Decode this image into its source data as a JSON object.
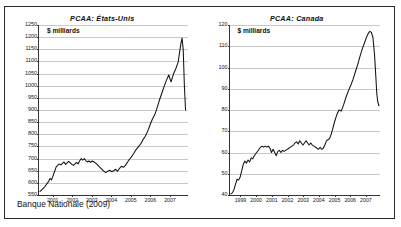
{
  "figure": {
    "source_note": "Banque Nationale (2009)",
    "border_color": "#2a2a2a",
    "line_color": "#111111",
    "grid_color": "#c9c9c9"
  },
  "chart_data": [
    {
      "type": "line",
      "title": "PCAA: États-Unis",
      "ylabel": "$ milliards",
      "xlabel": "",
      "ylim": [
        550,
        1250
      ],
      "yticks": [
        550,
        600,
        650,
        700,
        750,
        800,
        850,
        900,
        950,
        1000,
        1050,
        1100,
        1150,
        1200,
        1250
      ],
      "ytick_labels": [
        "550",
        "600",
        "650",
        "700",
        "750",
        "800",
        "850",
        "900",
        "950",
        "1000",
        "1050",
        "1100",
        "1150",
        "1200",
        "1250"
      ],
      "xlim": [
        2000.3,
        2007.9
      ],
      "xticks": [
        2001,
        2002,
        2003,
        2004,
        2005,
        2006,
        2007
      ],
      "xtick_labels": [
        "2001",
        "2002",
        "2003",
        "2004",
        "2005",
        "2006",
        "2007"
      ],
      "grid": true,
      "legend": "none",
      "x": [
        2000.35,
        2000.45,
        2000.55,
        2000.62,
        2000.7,
        2000.78,
        2000.86,
        2000.94,
        2001.02,
        2001.1,
        2001.18,
        2001.26,
        2001.34,
        2001.42,
        2001.5,
        2001.58,
        2001.66,
        2001.74,
        2001.82,
        2001.9,
        2001.98,
        2002.06,
        2002.14,
        2002.22,
        2002.3,
        2002.38,
        2002.46,
        2002.54,
        2002.62,
        2002.7,
        2002.78,
        2002.86,
        2002.94,
        2003.02,
        2003.12,
        2003.22,
        2003.32,
        2003.42,
        2003.52,
        2003.62,
        2003.72,
        2003.82,
        2003.92,
        2004.02,
        2004.12,
        2004.22,
        2004.32,
        2004.42,
        2004.52,
        2004.62,
        2004.72,
        2004.82,
        2004.92,
        2005.02,
        2005.14,
        2005.26,
        2005.38,
        2005.5,
        2005.62,
        2005.74,
        2005.86,
        2005.98,
        2006.1,
        2006.22,
        2006.34,
        2006.46,
        2006.58,
        2006.7,
        2006.82,
        2006.94,
        2007.06,
        2007.18,
        2007.3,
        2007.42,
        2007.5,
        2007.56,
        2007.62,
        2007.68,
        2007.74,
        2007.8
      ],
      "values": [
        565,
        572,
        580,
        586,
        596,
        604,
        618,
        612,
        630,
        648,
        666,
        672,
        678,
        674,
        680,
        686,
        676,
        682,
        688,
        682,
        676,
        672,
        678,
        684,
        678,
        690,
        700,
        694,
        700,
        692,
        686,
        690,
        684,
        690,
        686,
        680,
        672,
        664,
        656,
        648,
        642,
        648,
        652,
        646,
        650,
        656,
        648,
        660,
        668,
        664,
        672,
        684,
        696,
        706,
        720,
        736,
        748,
        760,
        778,
        792,
        812,
        838,
        862,
        880,
        908,
        940,
        968,
        996,
        1022,
        1044,
        1016,
        1048,
        1070,
        1096,
        1140,
        1172,
        1196,
        1150,
        1000,
        900
      ]
    },
    {
      "type": "line",
      "title": "PCAA: Canada",
      "ylabel": "$ milliards",
      "xlabel": "",
      "ylim": [
        40,
        120
      ],
      "yticks": [
        40,
        50,
        60,
        70,
        80,
        90,
        100,
        110,
        120
      ],
      "ytick_labels": [
        "40",
        "50",
        "60",
        "70",
        "80",
        "90",
        "100",
        "110",
        "120"
      ],
      "xlim": [
        1998.3,
        2007.9
      ],
      "xticks": [
        1999,
        2000,
        2001,
        2002,
        2003,
        2004,
        2005,
        2006,
        2007
      ],
      "xtick_labels": [
        "1999",
        "2000",
        "2001",
        "2002",
        "2003",
        "2004",
        "2005",
        "2006",
        "2007"
      ],
      "grid": true,
      "legend": "none",
      "x": [
        1998.35,
        1998.45,
        1998.55,
        1998.65,
        1998.75,
        1998.85,
        1998.95,
        1999.05,
        1999.15,
        1999.25,
        1999.35,
        1999.45,
        1999.55,
        1999.65,
        1999.75,
        1999.85,
        1999.95,
        2000.05,
        2000.15,
        2000.25,
        2000.35,
        2000.45,
        2000.55,
        2000.65,
        2000.75,
        2000.85,
        2000.95,
        2001.05,
        2001.15,
        2001.25,
        2001.35,
        2001.45,
        2001.55,
        2001.65,
        2001.75,
        2001.85,
        2001.95,
        2002.05,
        2002.15,
        2002.25,
        2002.35,
        2002.45,
        2002.55,
        2002.65,
        2002.75,
        2002.85,
        2002.95,
        2003.05,
        2003.15,
        2003.25,
        2003.35,
        2003.45,
        2003.55,
        2003.65,
        2003.75,
        2003.85,
        2003.95,
        2004.05,
        2004.15,
        2004.25,
        2004.35,
        2004.45,
        2004.55,
        2004.65,
        2004.75,
        2004.85,
        2004.95,
        2005.1,
        2005.25,
        2005.4,
        2005.55,
        2005.7,
        2005.85,
        2006.0,
        2006.15,
        2006.3,
        2006.45,
        2006.6,
        2006.75,
        2006.9,
        2007.02,
        2007.12,
        2007.22,
        2007.32,
        2007.42,
        2007.52,
        2007.6,
        2007.66,
        2007.72,
        2007.8
      ],
      "values": [
        40.5,
        41.0,
        42.5,
        45.0,
        47.5,
        47.0,
        48.5,
        51.5,
        54.5,
        56.0,
        55.0,
        56.5,
        55.5,
        57.5,
        57.0,
        58.5,
        59.5,
        60.5,
        61.5,
        62.5,
        63.0,
        62.5,
        63.0,
        62.5,
        63.0,
        62.0,
        60.0,
        61.5,
        60.0,
        58.5,
        60.5,
        61.0,
        60.0,
        61.0,
        60.5,
        61.0,
        61.5,
        62.0,
        62.5,
        63.0,
        63.5,
        64.5,
        65.0,
        64.0,
        65.5,
        64.5,
        63.5,
        64.5,
        65.5,
        64.5,
        63.5,
        64.5,
        63.5,
        63.0,
        62.5,
        62.0,
        61.5,
        62.5,
        61.5,
        62.0,
        63.5,
        65.5,
        66.0,
        66.5,
        68.5,
        71.0,
        74.0,
        77.5,
        80.0,
        79.5,
        82.5,
        86.0,
        89.0,
        91.5,
        94.5,
        98.0,
        101.5,
        105.5,
        109.0,
        112.0,
        114.5,
        116.0,
        117.0,
        116.5,
        114.0,
        106.0,
        96.0,
        88.0,
        84.0,
        82.0
      ]
    }
  ]
}
